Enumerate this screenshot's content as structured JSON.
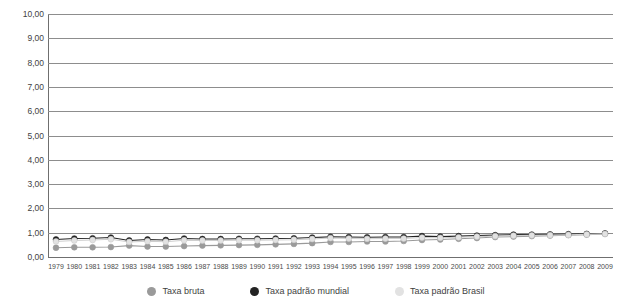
{
  "chart_data": {
    "type": "line",
    "title": "",
    "xlabel": "",
    "ylabel": "",
    "ylim": [
      0,
      10
    ],
    "ytick_labels": [
      "10,00",
      "9,00",
      "8,00",
      "7,00",
      "6,00",
      "5,00",
      "4,00",
      "3,00",
      "2,00",
      "1,00",
      "0,00"
    ],
    "ytick_values": [
      10,
      9,
      8,
      7,
      6,
      5,
      4,
      3,
      2,
      1,
      0
    ],
    "grid": true,
    "legend_position": "bottom",
    "categories": [
      "1979",
      "1980",
      "1981",
      "1982",
      "1983",
      "1984",
      "1985",
      "1986",
      "1987",
      "1988",
      "1989",
      "1990",
      "1991",
      "1992",
      "1993",
      "1994",
      "1995",
      "1996",
      "1997",
      "1998",
      "1999",
      "2000",
      "2001",
      "2002",
      "2003",
      "2004",
      "2005",
      "2006",
      "2007",
      "2008",
      "2009"
    ],
    "series": [
      {
        "name": "Taxa bruta",
        "color": "#9a9a9a",
        "marker": "circle",
        "values": [
          0.38,
          0.4,
          0.4,
          0.41,
          0.47,
          0.43,
          0.43,
          0.45,
          0.47,
          0.48,
          0.49,
          0.5,
          0.52,
          0.54,
          0.57,
          0.62,
          0.62,
          0.64,
          0.64,
          0.66,
          0.7,
          0.72,
          0.75,
          0.78,
          0.82,
          0.84,
          0.86,
          0.88,
          0.9,
          0.92,
          0.95
        ]
      },
      {
        "name": "Taxa padrão mundial",
        "color": "#232323",
        "marker": "circle",
        "values": [
          0.72,
          0.76,
          0.77,
          0.8,
          0.68,
          0.72,
          0.7,
          0.76,
          0.74,
          0.74,
          0.75,
          0.75,
          0.76,
          0.77,
          0.8,
          0.83,
          0.82,
          0.81,
          0.82,
          0.82,
          0.86,
          0.84,
          0.86,
          0.88,
          0.9,
          0.92,
          0.92,
          0.93,
          0.94,
          0.95,
          0.97
        ]
      },
      {
        "name": "Taxa padrão Brasil",
        "color": "#e2e2e2",
        "marker": "circle",
        "values": [
          0.64,
          0.68,
          0.7,
          0.73,
          0.62,
          0.65,
          0.63,
          0.69,
          0.68,
          0.68,
          0.69,
          0.69,
          0.7,
          0.71,
          0.74,
          0.78,
          0.76,
          0.75,
          0.76,
          0.76,
          0.8,
          0.79,
          0.81,
          0.84,
          0.86,
          0.88,
          0.89,
          0.9,
          0.91,
          0.93,
          0.95
        ]
      }
    ]
  },
  "legend": {
    "items": [
      {
        "label": "Taxa bruta",
        "color": "#9a9a9a"
      },
      {
        "label": "Taxa padrão mundial",
        "color": "#232323"
      },
      {
        "label": "Taxa padrão Brasil",
        "color": "#e2e2e2"
      }
    ]
  }
}
